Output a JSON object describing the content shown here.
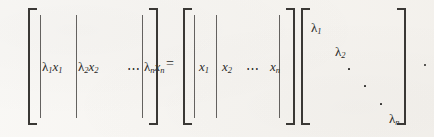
{
  "equation": {
    "description": "Eigenvalue decomposition column identity",
    "relation": "=",
    "trailing_punctuation": ".",
    "ink_color": "#2b2a28",
    "paper_color": "#f6f4f0",
    "ellipsis": "⋯"
  },
  "left_matrix": {
    "name": "lambda-scaled-eigenvector-matrix",
    "bracket_open": "[",
    "bracket_close": "]",
    "columns": [
      {
        "label": "λ",
        "sub1": "1",
        "var": "x",
        "sub2": "1",
        "text": "λ₁x₁"
      },
      {
        "label": "λ",
        "sub1": "2",
        "var": "x",
        "sub2": "2",
        "text": "λ₂x₂"
      },
      {
        "label": "λ",
        "sub1": "n",
        "var": "x",
        "sub2": "n",
        "text": "λₙxₙ"
      }
    ],
    "ellipsis": "⋯"
  },
  "middle_matrix": {
    "name": "eigenvector-matrix",
    "bracket_open": "[",
    "bracket_close": "]",
    "columns": [
      {
        "var": "x",
        "sub": "1",
        "text": "x₁"
      },
      {
        "var": "x",
        "sub": "2",
        "text": "x₂"
      },
      {
        "var": "x",
        "sub": "n",
        "text": "xₙ"
      }
    ],
    "ellipsis": "⋯"
  },
  "diagonal_matrix": {
    "name": "eigenvalue-diagonal-matrix",
    "bracket_open": "[",
    "bracket_close": "]",
    "entries": [
      {
        "label": "λ",
        "sub": "1",
        "text": "λ₁"
      },
      {
        "label": "λ",
        "sub": "2",
        "text": "λ₂"
      },
      {
        "label": "λ",
        "sub": "n",
        "text": "λₙ"
      }
    ],
    "diagonal_dots_count": 3
  }
}
